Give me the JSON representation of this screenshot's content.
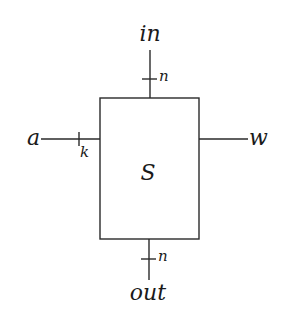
{
  "diagram": {
    "type": "block-diagram",
    "block": {
      "label": "S"
    },
    "ports": {
      "input_top": {
        "label": "in",
        "width_label": "n"
      },
      "output_bottom": {
        "label": "out",
        "width_label": "n"
      },
      "input_left": {
        "label": "a",
        "width_label": "k"
      },
      "output_right": {
        "label": "w"
      }
    },
    "colors": {
      "line": "#2a2a2a",
      "text": "#1a1a1a",
      "background": "#ffffff"
    }
  }
}
